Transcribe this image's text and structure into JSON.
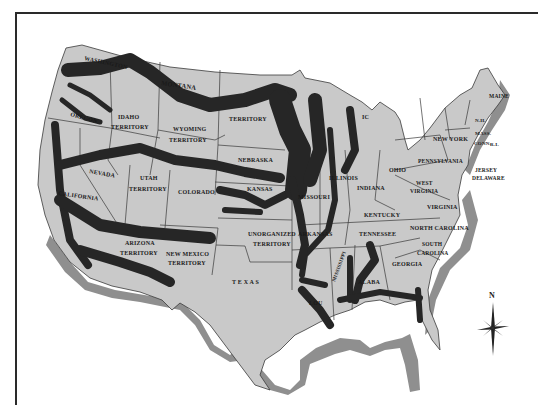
{
  "map": {
    "title": "",
    "frame": {
      "color": "#2a2a2a"
    },
    "colors": {
      "land": "#c9c9c9",
      "band": "#262626",
      "coast_shadow": "#8f8f8f",
      "border": "#3a3a3a",
      "water": "#ffffff"
    },
    "labels": {
      "washington": "WASHINGTON",
      "oregon": "OREGON",
      "california": "CALIFORNIA",
      "nevada": "NEVADA",
      "idaho1": "IDAHO",
      "idaho2": "TERRITORY",
      "montana": "MONTANA",
      "wyoming1": "WYOMING",
      "wyoming2": "TERRITORY",
      "utah1": "UTAH",
      "utah2": "TERRITORY",
      "colorado": "COLORADO",
      "arizona1": "ARIZONA",
      "arizona2": "TERRITORY",
      "newmexico1": "NEW MEXICO",
      "newmexico2": "TERRITORY",
      "dakota": "TERRITORY",
      "nebraska": "NEBRASKA",
      "kansas": "KANSAS",
      "unorg1": "UNORGANIZED",
      "unorg2": "TERRITORY",
      "texas": "T E X A S",
      "missouri": "MISSOURI",
      "arkansas": "ARKANSAS",
      "louisiana": "LOU",
      "mississippi": "MISSISSIPPI",
      "alabama": "ALABA",
      "illinois": "ILLINOIS",
      "indiana": "INDIANA",
      "ohio": "OHIO",
      "michigan": "IC",
      "kentucky": "KENTUCKY",
      "tennessee": "TENNESSEE",
      "georgia": "GEORGIA",
      "southcarolina1": "SOUTH",
      "southcarolina2": "CAROLINA",
      "northcarolina": "NORTH CAROLINA",
      "virginia": "VIRGINIA",
      "westvirginia1": "WEST",
      "westvirginia2": "VIRGINIA",
      "pennsylvania": "PENNSYLVANIA",
      "newyork": "NEW YORK",
      "newjersey": "JERSEY",
      "delaware": "DELAWARE",
      "maine": "MAINE",
      "nh": "N.H.",
      "mass": "MASS.",
      "conn": "CONN.",
      "ri": "R.I."
    },
    "compass": {
      "north_label": "N"
    }
  }
}
